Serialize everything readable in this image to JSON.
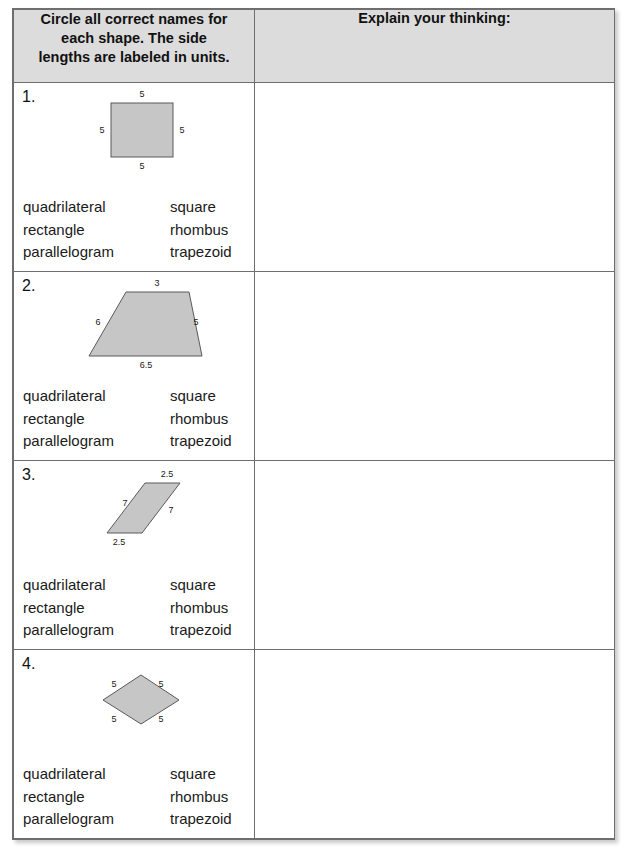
{
  "worksheet": {
    "header": {
      "left_line1": "Circle all correct names for",
      "left_line2": "each shape. The side",
      "left_line3": "lengths are labeled in units.",
      "right": "Explain your thinking:"
    },
    "name_options": {
      "col_a": [
        "quadrilateral",
        "rectangle",
        "parallelogram"
      ],
      "col_b": [
        "square",
        "rhombus",
        "trapezoid"
      ]
    },
    "colors": {
      "header_background": "#dcdcdc",
      "shape_fill": "#c6c6c6",
      "shape_stroke": "#5a5a5a",
      "border": "#6e6e6e",
      "text": "#1a1a1a"
    },
    "problems": [
      {
        "number": "1.",
        "shape": "square",
        "labels": {
          "top": "5",
          "left": "5",
          "right": "5",
          "bottom": "5"
        },
        "names_col_a": [
          "quadrilateral",
          "rectangle",
          "parallelogram"
        ],
        "names_col_b": [
          "square",
          "rhombus",
          "trapezoid"
        ],
        "explanation": ""
      },
      {
        "number": "2.",
        "shape": "trapezoid",
        "labels": {
          "top": "3",
          "left": "6",
          "right": "5",
          "bottom": "6.5"
        },
        "names_col_a": [
          "quadrilateral",
          "rectangle",
          "parallelogram"
        ],
        "names_col_b": [
          "square",
          "rhombus",
          "trapezoid"
        ],
        "explanation": ""
      },
      {
        "number": "3.",
        "shape": "parallelogram",
        "labels": {
          "top": "2.5",
          "left": "7",
          "right": "7",
          "bottom": "2.5"
        },
        "names_col_a": [
          "quadrilateral",
          "rectangle",
          "parallelogram"
        ],
        "names_col_b": [
          "square",
          "rhombus",
          "trapezoid"
        ],
        "explanation": ""
      },
      {
        "number": "4.",
        "shape": "rhombus",
        "labels": {
          "top_left": "5",
          "top_right": "5",
          "bottom_left": "5",
          "bottom_right": "5"
        },
        "names_col_a": [
          "quadrilateral",
          "rectangle",
          "parallelogram"
        ],
        "names_col_b": [
          "square",
          "rhombus",
          "trapezoid"
        ],
        "explanation": ""
      }
    ]
  }
}
